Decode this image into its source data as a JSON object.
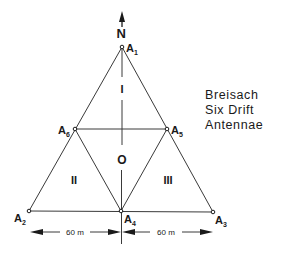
{
  "title": {
    "lines": [
      "Breisach",
      "Six Drift",
      "Antennae"
    ]
  },
  "north_label": "N",
  "antennas": [
    {
      "id": "A1",
      "label": "A",
      "sub": "1",
      "x": 122,
      "y": 47
    },
    {
      "id": "A2",
      "label": "A",
      "sub": "2",
      "x": 29,
      "y": 211
    },
    {
      "id": "A3",
      "label": "A",
      "sub": "3",
      "x": 213,
      "y": 212
    },
    {
      "id": "A4",
      "label": "A",
      "sub": "4",
      "x": 121,
      "y": 211
    },
    {
      "id": "A5",
      "label": "A",
      "sub": "5",
      "x": 167,
      "y": 129
    },
    {
      "id": "A6",
      "label": "A",
      "sub": "6",
      "x": 75,
      "y": 129
    }
  ],
  "regions": {
    "I": "I",
    "II": "II",
    "III": "III",
    "O": "O"
  },
  "dimensions": {
    "left": "60 m",
    "right": "60 m"
  },
  "colors": {
    "line": "#3a3a3a",
    "text": "#1a1a1a",
    "background": "#ffffff"
  }
}
